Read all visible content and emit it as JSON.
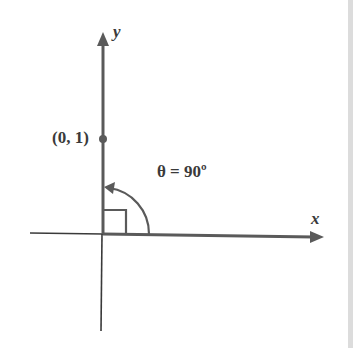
{
  "diagram": {
    "axes": {
      "x_label": "x",
      "y_label": "y"
    },
    "point": {
      "label": "(0, 1)",
      "x": 0,
      "y": 1
    },
    "angle": {
      "label": "θ = 90º",
      "degrees": 90,
      "right_angle_marker": true
    },
    "colors": {
      "axis_thick": "#5a5a5a",
      "axis_thin": "#3a3a3a",
      "text": "#3a3a3a",
      "background": "#ffffff",
      "edge_strip": "#dcdcdc"
    }
  }
}
